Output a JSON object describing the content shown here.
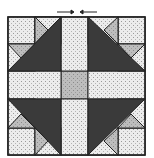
{
  "diagram": {
    "type": "quilt-block",
    "colors": {
      "light": "#ececec",
      "medium": "#bdbdbd",
      "dark": "#3a3a3a",
      "outline": "#222222",
      "background": "#ffffff"
    },
    "arrows": [
      {
        "direction": "right",
        "position": "top-left-of-center"
      },
      {
        "direction": "left",
        "position": "top-right-of-center"
      }
    ]
  }
}
